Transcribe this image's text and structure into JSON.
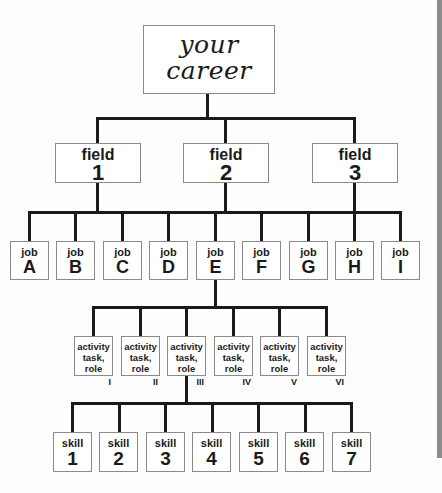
{
  "root": {
    "label": "your\ncareer"
  },
  "fields": [
    {
      "label": "field",
      "number": "1"
    },
    {
      "label": "field",
      "number": "2"
    },
    {
      "label": "field",
      "number": "3"
    }
  ],
  "jobs": [
    {
      "label": "job",
      "letter": "A"
    },
    {
      "label": "job",
      "letter": "B"
    },
    {
      "label": "job",
      "letter": "C"
    },
    {
      "label": "job",
      "letter": "D"
    },
    {
      "label": "job",
      "letter": "E"
    },
    {
      "label": "job",
      "letter": "F"
    },
    {
      "label": "job",
      "letter": "G"
    },
    {
      "label": "job",
      "letter": "H"
    },
    {
      "label": "job",
      "letter": "I"
    }
  ],
  "expanded_job": "E",
  "activities": [
    {
      "label": "activity\ntask,\nrole",
      "numeral": "I"
    },
    {
      "label": "activity\ntask,\nrole",
      "numeral": "II"
    },
    {
      "label": "activity\ntask,\nrole",
      "numeral": "III"
    },
    {
      "label": "activity\ntask,\nrole",
      "numeral": "IV"
    },
    {
      "label": "activity\ntask,\nrole",
      "numeral": "V"
    },
    {
      "label": "activity\ntask,\nrole",
      "numeral": "VI"
    }
  ],
  "expanded_activity": "III",
  "skills": [
    {
      "label": "skill",
      "number": "1"
    },
    {
      "label": "skill",
      "number": "2"
    },
    {
      "label": "skill",
      "number": "3"
    },
    {
      "label": "skill",
      "number": "4"
    },
    {
      "label": "skill",
      "number": "5"
    },
    {
      "label": "skill",
      "number": "6"
    },
    {
      "label": "skill",
      "number": "7"
    }
  ]
}
